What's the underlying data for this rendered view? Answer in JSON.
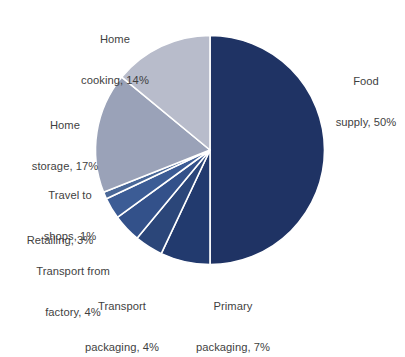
{
  "chart_data": {
    "type": "pie",
    "title": "",
    "subtitle": "",
    "xlabel": "",
    "ylabel": "",
    "legend_position": "none",
    "grid": false,
    "labels_position": "outside",
    "start_angle_deg": 0,
    "direction": "clockwise",
    "units": "%",
    "categories": [
      "Food supply",
      "Primary packaging",
      "Transport packaging",
      "Transport from factory",
      "Retailing",
      "Travel to shops",
      "Home storage",
      "Home cooking"
    ],
    "values": [
      50,
      7,
      4,
      4,
      3,
      1,
      17,
      14
    ],
    "slices": [
      {
        "id": "food-supply",
        "label": "Food supply",
        "value": 50,
        "display": "Food supply, 50%",
        "line1": "Food",
        "line2": "supply, 50%",
        "color": "#1f3364"
      },
      {
        "id": "primary-packaging",
        "label": "Primary packaging",
        "value": 7,
        "display": "Primary packaging, 7%",
        "line1": "Primary",
        "line2": "packaging, 7%",
        "color": "#223a6e"
      },
      {
        "id": "transport-packaging",
        "label": "Transport packaging",
        "value": 4,
        "display": "Transport packaging, 4%",
        "line1": "Transport",
        "line2": "packaging, 4%",
        "color": "#2b4679"
      },
      {
        "id": "transport-factory",
        "label": "Transport from factory",
        "value": 4,
        "display": "Transport from factory, 4%",
        "line1": "Transport from",
        "line2": "factory, 4%",
        "color": "#33518a"
      },
      {
        "id": "retailing",
        "label": "Retailing",
        "value": 3,
        "display": "Retailing, 3%",
        "line1": "Retailing, 3%",
        "line2": "",
        "color": "#3c5c95"
      },
      {
        "id": "travel-to-shops",
        "label": "Travel to shops",
        "value": 1,
        "display": "Travel to shops, 1%",
        "line1": "Travel to",
        "line2": "shops, 1%",
        "color": "#4a6898"
      },
      {
        "id": "home-storage",
        "label": "Home storage",
        "value": 17,
        "display": "Home storage, 17%",
        "line1": "Home",
        "line2": "storage, 17%",
        "color": "#9aa2b8"
      },
      {
        "id": "home-cooking",
        "label": "Home cooking",
        "value": 14,
        "display": "Home cooking, 14%",
        "line1": "Home",
        "line2": "cooking, 14%",
        "color": "#b8bccb"
      }
    ],
    "total": 100,
    "background_color": "#ffffff",
    "slice_border_color": "#ffffff",
    "label_text_color": "#3f3f3f"
  },
  "labels": {
    "food_supply_line1": "Food",
    "food_supply_line2": "supply, 50%",
    "primary_packaging_line1": "Primary",
    "primary_packaging_line2": "packaging, 7%",
    "transport_packaging_line1": "Transport",
    "transport_packaging_line2": "packaging, 4%",
    "transport_factory_line1": "Transport from",
    "transport_factory_line2": "factory, 4%",
    "retailing_line1": "Retailing, 3%",
    "travel_shops_line1": "Travel to",
    "travel_shops_line2": "shops, 1%",
    "home_storage_line1": "Home",
    "home_storage_line2": "storage, 17%",
    "home_cooking_line1": "Home",
    "home_cooking_line2": "cooking, 14%"
  }
}
